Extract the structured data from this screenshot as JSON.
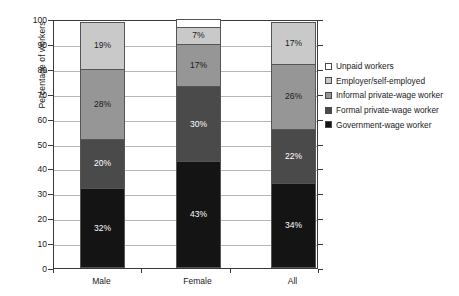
{
  "chart_data": {
    "type": "bar",
    "subtype": "stacked-vertical",
    "title": "",
    "xlabel": "",
    "ylabel": "Percentage of workers",
    "categories": [
      "Male",
      "Female",
      "All"
    ],
    "ylim": [
      0,
      100
    ],
    "yticks": [
      0,
      10,
      20,
      30,
      40,
      50,
      60,
      70,
      80,
      90,
      100
    ],
    "ytick_labels": [
      "0",
      "10",
      "20",
      "30",
      "40",
      "50",
      "60",
      "70",
      "80",
      "90",
      "100"
    ],
    "grid": true,
    "legend_position": "right",
    "stack_order_bottom_to_top": [
      "Government-wage worker",
      "Formal private-wage worker",
      "Informal private-wage worker",
      "Employer/self-employed",
      "Unpaid workers"
    ],
    "series": [
      {
        "name": "Government-wage worker",
        "color": "#141414",
        "label_color": "#ffffff",
        "values": [
          32,
          43,
          34
        ],
        "labels": [
          "32%",
          "43%",
          "34%"
        ]
      },
      {
        "name": "Formal private-wage worker",
        "color": "#4a4a4a",
        "label_color": "#ffffff",
        "values": [
          20,
          30,
          22
        ],
        "labels": [
          "20%",
          "30%",
          "22%"
        ]
      },
      {
        "name": "Informal private-wage worker",
        "color": "#969696",
        "label_color": "#1a1a1a",
        "values": [
          28,
          17,
          26
        ],
        "labels": [
          "28%",
          "17%",
          "26%"
        ]
      },
      {
        "name": "Employer/self-employed",
        "color": "#c9c9c9",
        "label_color": "#1a1a1a",
        "values": [
          19,
          7,
          17
        ],
        "labels": [
          "19%",
          "7%",
          "17%"
        ]
      },
      {
        "name": "Unpaid workers",
        "color": "#ffffff",
        "label_color": "#1a1a1a",
        "values": [
          0,
          3,
          0
        ],
        "labels": [
          "",
          "",
          ""
        ]
      }
    ]
  },
  "legend": {
    "items": [
      {
        "label": "Unpaid workers",
        "color": "#ffffff"
      },
      {
        "label": "Employer/self-employed",
        "color": "#c9c9c9"
      },
      {
        "label": "Informal private-wage worker",
        "color": "#969696"
      },
      {
        "label": "Formal private-wage worker",
        "color": "#4a4a4a"
      },
      {
        "label": "Government-wage worker",
        "color": "#141414"
      }
    ]
  },
  "axes": {
    "y_title": "Percentage of workers",
    "y_labels": [
      "100",
      "90",
      "80",
      "70",
      "60",
      "50",
      "40",
      "30",
      "20",
      "10",
      "0"
    ],
    "x_labels": [
      "Male",
      "Female",
      "All"
    ]
  }
}
